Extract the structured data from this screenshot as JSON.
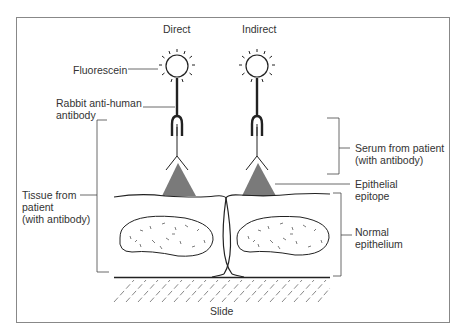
{
  "diagram": {
    "columns": {
      "direct": "Direct",
      "indirect": "Indirect"
    },
    "labels": {
      "fluorescein": "Fluorescein",
      "rabbit_antibody_1": "Rabbit anti-human",
      "rabbit_antibody_2": "antibody",
      "serum_1": "Serum from patient",
      "serum_2": "(with antibody)",
      "tissue_1": "Tissue from",
      "tissue_2": "patient",
      "tissue_3": "(with antibody)",
      "epitope_1": "Epithelial",
      "epitope_2": "epitope",
      "epithelium_1": "Normal",
      "epithelium_2": "epithelium",
      "slide": "Slide"
    },
    "colors": {
      "line": "#222222",
      "epitope": "#7a7a7a",
      "frame": "#888888"
    }
  }
}
